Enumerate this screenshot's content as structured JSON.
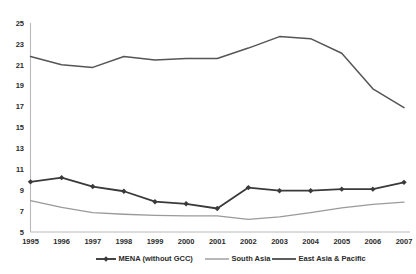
{
  "chart_data": {
    "type": "line",
    "title": "",
    "subtitle": "",
    "xlabel": "",
    "ylabel": "",
    "categories": [
      "1995",
      "1996",
      "1997",
      "1998",
      "1999",
      "2000",
      "2001",
      "2002",
      "2003",
      "2004",
      "2005",
      "2006",
      "2007"
    ],
    "x": [
      1995,
      1996,
      1997,
      1998,
      1999,
      2000,
      2001,
      2002,
      2003,
      2004,
      2005,
      2006,
      2007
    ],
    "ylim": [
      5,
      25
    ],
    "yticks": [
      5,
      7,
      9,
      11,
      13,
      15,
      17,
      19,
      21,
      23,
      25
    ],
    "ytick_labels": [
      "5",
      "7",
      "9",
      "11",
      "13",
      "15",
      "17",
      "19",
      "21",
      "23",
      "25"
    ],
    "grid": false,
    "legend_position": "bottom",
    "series": [
      {
        "name": "MENA (without GCC)",
        "color": "#3a3a3a",
        "marker": "diamond",
        "line_width": 1.8,
        "values": [
          9.8,
          10.2,
          9.35,
          8.9,
          7.9,
          7.7,
          7.25,
          9.25,
          8.95,
          8.95,
          9.1,
          9.1,
          9.75
        ]
      },
      {
        "name": "South Asia",
        "color": "#9a9a9a",
        "marker": "none",
        "line_width": 1.3,
        "values": [
          8.0,
          7.35,
          6.85,
          6.7,
          6.6,
          6.55,
          6.55,
          6.2,
          6.45,
          6.85,
          7.3,
          7.65,
          7.85
        ]
      },
      {
        "name": "East Asia & Pacific",
        "color": "#555555",
        "marker": "none",
        "line_width": 1.5,
        "values": [
          21.8,
          21.0,
          20.75,
          21.8,
          21.45,
          21.6,
          21.6,
          22.6,
          23.7,
          23.5,
          22.1,
          18.7,
          16.9
        ]
      }
    ]
  },
  "legend": {
    "items": [
      {
        "label": "MENA (without GCC)",
        "color": "#3a3a3a",
        "marker": "diamond"
      },
      {
        "label": "South Asia",
        "color": "#9a9a9a",
        "marker": "none"
      },
      {
        "label": "East Asia & Pacific",
        "color": "#555555",
        "marker": "none"
      }
    ]
  },
  "axes": {
    "y_axis_color": "#b9b9b9",
    "x_axis_color": "#b9b9b9",
    "background": "#ffffff"
  }
}
